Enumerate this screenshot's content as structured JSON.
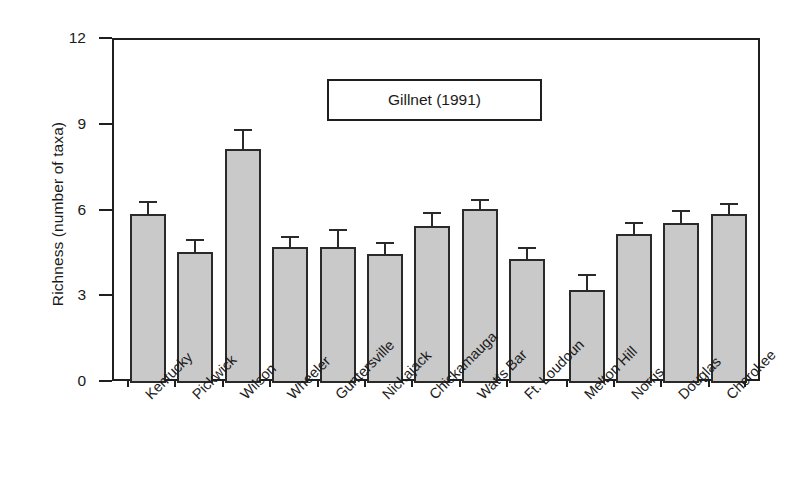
{
  "chart_data": {
    "type": "bar",
    "title": "",
    "annotation": "Gillnet (1991)",
    "xlabel": "",
    "ylabel": "Richness (number of taxa)",
    "ylim": [
      0,
      12
    ],
    "yticks": [
      0,
      3,
      6,
      9,
      12
    ],
    "ytick_labels": [
      "0",
      "3",
      "6",
      "9",
      "12"
    ],
    "grid": false,
    "legend_position": "inside-top-center",
    "error_bar_direction": "upper-only",
    "categories": [
      "Kentucky",
      "Pickwick",
      "Wilson",
      "Wheeler",
      "Guntersville",
      "Nickajack",
      "Chickamauga",
      "Watts Bar",
      "Ft. Loudoun",
      "Melton Hill",
      "Norris",
      "Douglas",
      "Cherokee"
    ],
    "values": [
      5.9,
      4.6,
      8.2,
      4.75,
      4.75,
      4.5,
      5.5,
      6.1,
      4.35,
      3.25,
      5.2,
      5.6,
      5.9
    ],
    "errors": [
      0.45,
      0.45,
      0.7,
      0.4,
      0.65,
      0.45,
      0.5,
      0.35,
      0.4,
      0.55,
      0.45,
      0.45,
      0.4
    ],
    "series": [
      {
        "name": "Gillnet (1991)",
        "values": [
          5.9,
          4.6,
          8.2,
          4.75,
          4.75,
          4.5,
          5.5,
          6.1,
          4.35,
          3.25,
          5.2,
          5.6,
          5.9
        ],
        "errors": [
          0.45,
          0.45,
          0.7,
          0.4,
          0.65,
          0.45,
          0.5,
          0.35,
          0.4,
          0.55,
          0.45,
          0.45,
          0.4
        ]
      }
    ],
    "colors": {
      "bar_fill": "#c9c9c9",
      "bar_edge": "#2a2a2a",
      "axis": "#1f1f1f",
      "text": "#1a1a1a",
      "background": "#ffffff"
    }
  },
  "legend": {
    "label": "Gillnet (1991)"
  },
  "axes": {
    "y_title": "Richness (number of taxa)"
  }
}
